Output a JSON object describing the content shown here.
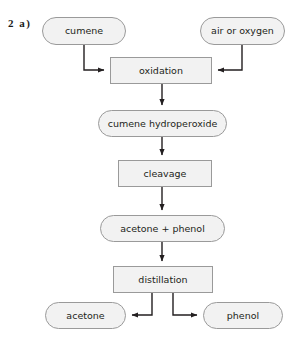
{
  "question_label": "2  a)",
  "diagram": {
    "nodes": [
      {
        "id": "cumene",
        "label": "cumene",
        "shape": "rounded",
        "x": 42,
        "y": 17,
        "w": 84,
        "h": 28
      },
      {
        "id": "air_oxygen",
        "label": "air or oxygen",
        "shape": "rounded",
        "x": 200,
        "y": 17,
        "w": 85,
        "h": 28
      },
      {
        "id": "oxidation",
        "label": "oxidation",
        "shape": "rect",
        "x": 110,
        "y": 57,
        "w": 102,
        "h": 27
      },
      {
        "id": "hydroperoxide",
        "label": "cumene hydroperoxide",
        "shape": "rounded",
        "x": 98,
        "y": 110,
        "w": 129,
        "h": 27
      },
      {
        "id": "cleavage",
        "label": "cleavage",
        "shape": "rect",
        "x": 118,
        "y": 160,
        "w": 94,
        "h": 27
      },
      {
        "id": "acetone_phenol",
        "label": "acetone + phenol",
        "shape": "rounded",
        "x": 100,
        "y": 215,
        "w": 125,
        "h": 27
      },
      {
        "id": "distillation",
        "label": "distillation",
        "shape": "rect",
        "x": 113,
        "y": 266,
        "w": 100,
        "h": 27
      },
      {
        "id": "acetone",
        "label": "acetone",
        "shape": "rounded",
        "x": 45,
        "y": 302,
        "w": 81,
        "h": 27
      },
      {
        "id": "phenol",
        "label": "phenol",
        "shape": "rounded",
        "x": 203,
        "y": 302,
        "w": 80,
        "h": 27
      }
    ],
    "edges": [
      {
        "from": "cumene",
        "to": "oxidation",
        "kind": "elbow-down-right"
      },
      {
        "from": "air_oxygen",
        "to": "oxidation",
        "kind": "elbow-down-left"
      },
      {
        "from": "oxidation",
        "to": "hydroperoxide",
        "kind": "straight-down"
      },
      {
        "from": "hydroperoxide",
        "to": "cleavage",
        "kind": "straight-down"
      },
      {
        "from": "cleavage",
        "to": "acetone_phenol",
        "kind": "straight-down"
      },
      {
        "from": "acetone_phenol",
        "to": "distillation",
        "kind": "straight-down"
      },
      {
        "from": "distillation",
        "to": "acetone",
        "kind": "elbow-down-left"
      },
      {
        "from": "distillation",
        "to": "phenol",
        "kind": "elbow-down-right"
      }
    ]
  },
  "colors": {
    "node_fill": "#f2f2f2",
    "node_border": "#9a9a9a",
    "arrow": "#231f20",
    "text": "#231f20",
    "background": "#ffffff"
  }
}
